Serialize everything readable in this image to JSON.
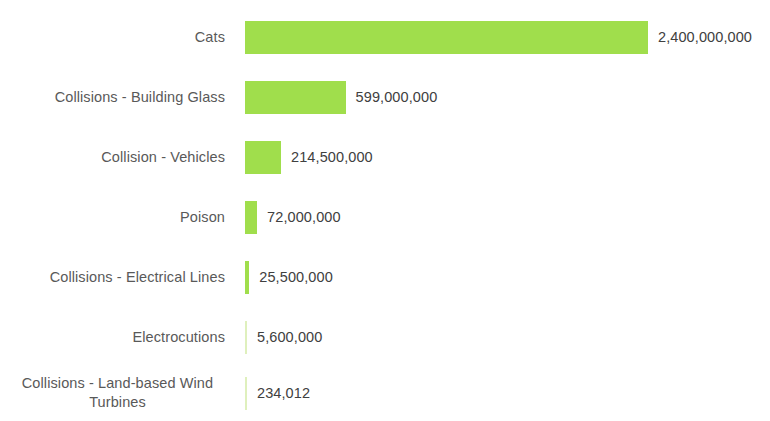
{
  "chart_data": {
    "type": "bar",
    "orientation": "horizontal",
    "title": "",
    "subtitle": "",
    "xlabel": "",
    "ylabel": "",
    "grid": false,
    "legend": false,
    "axis_visible": false,
    "xlim": [
      0,
      2400000000
    ],
    "categories": [
      "Cats",
      "Collisions - Building Glass",
      "Collision - Vehicles",
      "Poison",
      "Collisions - Electrical Lines",
      "Electrocutions",
      "Collisions - Land-based Wind Turbines"
    ],
    "values": [
      2400000000,
      599000000,
      214500000,
      72000000,
      25500000,
      5600000,
      234012
    ],
    "value_labels": [
      "2,400,000,000",
      "599,000,000",
      "214,500,000",
      "72,000,000",
      "25,500,000",
      "5,600,000",
      "234,012"
    ],
    "bar_color": "#a0de4c",
    "bar_color_faint": "#dff0bd",
    "label_color": "#595959",
    "value_color": "#404040",
    "background_color": "#ffffff"
  },
  "layout": {
    "label_column_width_px": 235,
    "bar_origin_x_px": 245,
    "row_height_px": 60,
    "bar_height_px": 33,
    "pixels_per_unit": 1.679e-07,
    "row_tops_px": [
      10,
      70,
      130,
      190,
      250,
      310,
      365
    ],
    "row_heights_px": [
      54,
      54,
      54,
      54,
      54,
      54,
      56
    ]
  }
}
